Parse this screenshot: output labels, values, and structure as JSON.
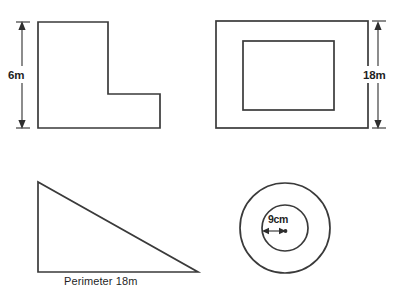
{
  "page": {
    "background_color": "#ffffff",
    "stroke_color": "#3a3a3a",
    "text_color": "#1f1f1f"
  },
  "figures": [
    {
      "id": "l-shape",
      "name": "L-shaped polygon",
      "label": "6m",
      "label_meaning": "height",
      "dimension_orientation": "vertical",
      "vertices": [
        [
          38,
          22
        ],
        [
          108,
          22
        ],
        [
          108,
          94
        ],
        [
          160,
          94
        ],
        [
          160,
          128
        ],
        [
          38,
          128
        ]
      ]
    },
    {
      "id": "nested-rectangles",
      "name": "Rectangle with inner rectangle",
      "label": "18m",
      "label_meaning": "height",
      "dimension_orientation": "vertical",
      "outer_rect": {
        "x": 216,
        "y": 21,
        "width": 152,
        "height": 107
      },
      "inner_rect": {
        "x": 243,
        "y": 41,
        "width": 91,
        "height": 69
      }
    },
    {
      "id": "right-triangle",
      "name": "Right triangle",
      "label": "Perimeter 18m",
      "label_meaning": "perimeter",
      "vertices": [
        [
          38,
          182
        ],
        [
          38,
          272
        ],
        [
          198,
          272
        ]
      ]
    },
    {
      "id": "concentric-circles",
      "name": "Concentric circles",
      "label": "9cm",
      "label_meaning": "radius of inner circle",
      "center": [
        285,
        228
      ],
      "outer_radius": 45,
      "inner_radius": 23
    }
  ],
  "labels": {
    "l_shape_height": "6m",
    "rectangle_height": "18m",
    "triangle_perimeter": "Perimeter 18m",
    "circle_radius": "9cm"
  }
}
